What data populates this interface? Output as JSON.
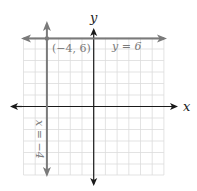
{
  "diagram": {
    "type": "coordinate-plane",
    "axes": {
      "x_label": "x",
      "y_label": "y"
    },
    "grid": {
      "x_min": -6,
      "x_max": 6,
      "y_min": -6,
      "y_max": 6,
      "step": 1
    },
    "lines": [
      {
        "equation": "y = 6",
        "label": "y = 6",
        "orientation": "horizontal",
        "value": 6
      },
      {
        "equation": "x = -4",
        "label": "x = −4",
        "orientation": "vertical",
        "value": -4
      }
    ],
    "points": [
      {
        "label": "(−4, 6)",
        "x": -4,
        "y": 6
      }
    ],
    "colors": {
      "axis": "#1a1a1a",
      "line": "#7a7a7a",
      "grid": "#dcdcdc"
    }
  }
}
